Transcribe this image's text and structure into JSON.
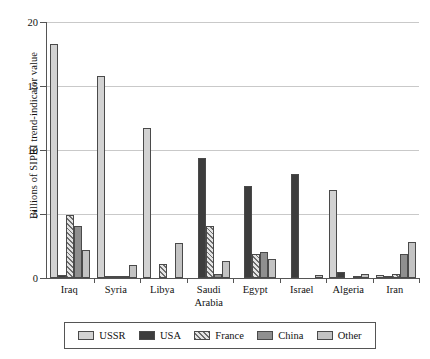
{
  "chart_data": {
    "type": "bar",
    "title": "",
    "subtitle": "",
    "xlabel": "",
    "ylabel": "Billions of SIPRI trend-indicator value",
    "ylim": [
      0,
      20
    ],
    "yticks": [
      0,
      5,
      10,
      15,
      20
    ],
    "ytick_labels": [
      "0",
      "5",
      "10",
      "15",
      "20"
    ],
    "grid": true,
    "legend_position": "bottom",
    "categories": [
      "Iraq",
      "Syria",
      "Libya",
      "Saudi\nArabia",
      "Egypt",
      "Israel",
      "Algeria",
      "Iran"
    ],
    "series": [
      {
        "name": "USSR",
        "color": "#d2d2d2",
        "pattern": "solid-light",
        "values": [
          18.3,
          15.8,
          11.7,
          0.0,
          0.0,
          0.0,
          6.9,
          0.2
        ]
      },
      {
        "name": "USA",
        "color": "#3d3d3d",
        "pattern": "solid-dark",
        "values": [
          0.2,
          0.05,
          0.0,
          9.4,
          7.2,
          8.1,
          0.5,
          0.1
        ]
      },
      {
        "name": "France",
        "color": "#cfcfcf",
        "pattern": "diagonal-hatch",
        "values": [
          4.9,
          0.05,
          1.1,
          4.1,
          1.9,
          0.0,
          0.0,
          0.3
        ]
      },
      {
        "name": "China",
        "color": "#8f8f8f",
        "pattern": "solid-medium",
        "values": [
          4.1,
          0.05,
          0.0,
          0.3,
          2.0,
          0.0,
          0.15,
          1.9
        ]
      },
      {
        "name": "Other",
        "color": "#c3c3c3",
        "pattern": "solid-light",
        "values": [
          2.2,
          1.0,
          2.7,
          1.3,
          1.5,
          0.2,
          0.3,
          2.8
        ]
      }
    ]
  },
  "legend": {
    "items": [
      {
        "label": "USSR"
      },
      {
        "label": "USA"
      },
      {
        "label": "France"
      },
      {
        "label": "China"
      },
      {
        "label": "Other"
      }
    ]
  }
}
